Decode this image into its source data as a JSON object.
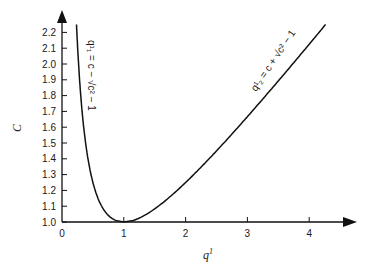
{
  "chart_data": {
    "type": "line",
    "title": "",
    "xlabel": "q¹",
    "ylabel": "C",
    "xlim": [
      0,
      4.3
    ],
    "ylim": [
      1.0,
      2.25
    ],
    "x_ticks": [
      "0",
      "1",
      "2",
      "3",
      "4"
    ],
    "y_ticks": [
      "1.0",
      "1.1",
      "1.2",
      "1.3",
      "1.4",
      "1.5",
      "1.6",
      "1.7",
      "1.8",
      "1.9",
      "2.0",
      "2.1",
      "2.2"
    ],
    "grid": false,
    "legend": null,
    "series": [
      {
        "name": "q¹₁ = c − √(c² − 1)",
        "x": [
          0.22,
          0.24,
          0.27,
          0.29,
          0.32,
          0.35,
          0.39,
          0.43,
          0.48,
          0.54,
          0.63,
          0.75,
          1.0
        ],
        "y": [
          2.25,
          2.2,
          2.1,
          2.0,
          1.9,
          1.8,
          1.7,
          1.6,
          1.5,
          1.4,
          1.3,
          1.2,
          1.0
        ]
      },
      {
        "name": "q¹₂ = c + √(c² − 1)",
        "x": [
          1.0,
          1.66,
          1.88,
          2.06,
          2.24,
          2.41,
          2.59,
          2.78,
          2.96,
          3.15,
          3.35,
          3.55,
          3.76,
          3.96,
          4.16,
          4.26
        ],
        "y": [
          1.0,
          1.1,
          1.2,
          1.3,
          1.4,
          1.5,
          1.6,
          1.7,
          1.8,
          1.9,
          2.0,
          2.1,
          2.2,
          2.3,
          2.4,
          2.45
        ]
      }
    ],
    "annotations": [
      {
        "text": "q¹₁ = c − √(c² − 1)",
        "near": "left branch, rotated vertical"
      },
      {
        "text": "q¹₂ = c + √(c² − 1)",
        "near": "right branch, rotated along curve"
      }
    ]
  },
  "labels": {
    "xlabel": "q",
    "xlabel_sup": "1",
    "ylabel": "C",
    "ann_left": "q¹₁ = c − √c² − 1",
    "ann_right": "q¹₂ = c + √c² − 1",
    "x_ticks": [
      "0",
      "1",
      "2",
      "3",
      "4"
    ],
    "y_ticks": [
      "1.0",
      "1.1",
      "1.2",
      "1.3",
      "1.4",
      "1.5",
      "1.6",
      "1.7",
      "1.8",
      "1.9",
      "2.0",
      "2.1",
      "2.2"
    ]
  }
}
